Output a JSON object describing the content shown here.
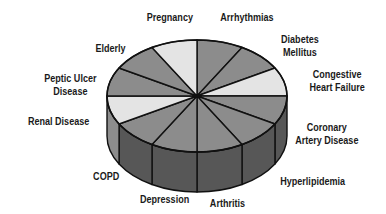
{
  "chart_data": {
    "type": "pie",
    "style": "3d",
    "title": "",
    "categories": [
      "Arrhythmias",
      "Diabetes Mellitus",
      "Congestive Heart Failure",
      "Coronary Artery Disease",
      "Hyperlipidemia",
      "Arthritis",
      "Depression",
      "COPD",
      "Renal Disease",
      "Peptic Ulcer Disease",
      "Elderly",
      "Pregnancy"
    ],
    "values": [
      1,
      1,
      1,
      1,
      1,
      1,
      1,
      1,
      1,
      1,
      1,
      1
    ],
    "slice_shades": [
      "#8c8c8c",
      "#8c8c8c",
      "#e4e4e4",
      "#8c8c8c",
      "#8c8c8c",
      "#8c8c8c",
      "#8c8c8c",
      "#8c8c8c",
      "#e4e4e4",
      "#8c8c8c",
      "#8c8c8c",
      "#e4e4e4"
    ],
    "legend": "labels around pie",
    "grid": false
  },
  "labels": [
    {
      "text": "Pregnancy",
      "x": 170,
      "y": 11
    },
    {
      "text": "Arrhythmias",
      "x": 247,
      "y": 11
    },
    {
      "text": "Diabetes\nMellitus",
      "x": 300,
      "y": 33
    },
    {
      "text": "Congestive\nHeart Failure",
      "x": 337,
      "y": 68
    },
    {
      "text": "Coronary\nArtery Disease",
      "x": 327,
      "y": 121
    },
    {
      "text": "Hyperlipidemia",
      "x": 312,
      "y": 175
    },
    {
      "text": "Arthritis",
      "x": 227,
      "y": 197
    },
    {
      "text": "Depression",
      "x": 164,
      "y": 193
    },
    {
      "text": "COPD",
      "x": 106,
      "y": 170
    },
    {
      "text": "Renal Disease",
      "x": 58,
      "y": 115
    },
    {
      "text": "Peptic Ulcer\nDisease",
      "x": 70,
      "y": 72
    },
    {
      "text": "Elderly",
      "x": 110,
      "y": 42
    }
  ]
}
